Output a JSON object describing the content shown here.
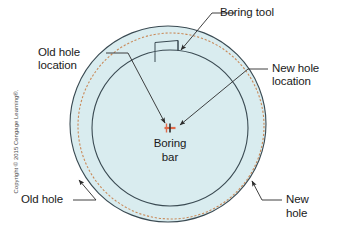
{
  "figure": {
    "type": "technical-diagram",
    "colors": {
      "workpiece_fill": "#d9ecef",
      "new_hole_stroke": "#3a4a52",
      "old_hole_stroke": "#c98a5a",
      "inner_circle_stroke": "#3a4a52",
      "leader_line": "#2b2b2b",
      "center_marker": "#e06a4a",
      "text": "#1a1a1a",
      "copyright_text": "#4a4a4a",
      "background": "#ffffff"
    },
    "geometry": {
      "new_hole": {
        "cx": 168,
        "cy": 124,
        "r": 98,
        "style": "solid"
      },
      "old_hole": {
        "cx": 171,
        "cy": 126,
        "r": 93,
        "style": "dashed"
      },
      "boring_bar_circle": {
        "cx": 170,
        "cy": 128,
        "r": 78,
        "style": "solid"
      },
      "center_marker": {
        "cx": 170,
        "cy": 128
      },
      "boring_tool_rect": {
        "x": 155,
        "y": 40,
        "w": 23,
        "h": 22
      }
    }
  },
  "labels": {
    "boring_tool": "Boring tool",
    "old_hole_location_line1": "Old hole",
    "old_hole_location_line2": "location",
    "new_hole_location_line1": "New hole",
    "new_hole_location_line2": "location",
    "boring_bar_line1": "Boring",
    "boring_bar_line2": "bar",
    "old_hole": "Old hole",
    "new_hole_line1": "New",
    "new_hole_line2": "hole"
  },
  "copyright": {
    "notice": "Copyright © 2015 Cengage Learning®."
  }
}
